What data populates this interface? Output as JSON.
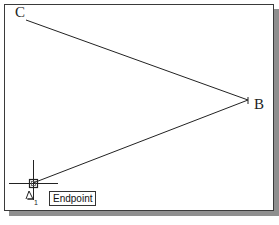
{
  "canvas": {
    "background": "#ffffff",
    "border_color": "#3a3a3a",
    "shadow_color": "#8f8f8f"
  },
  "points": [
    {
      "id": "C",
      "label": "C",
      "x": 26,
      "y": 20
    },
    {
      "id": "B",
      "label": "B",
      "x": 248,
      "y": 100
    },
    {
      "id": "A",
      "label": "A",
      "x": 33,
      "y": 183
    }
  ],
  "lines": [
    {
      "from": "C",
      "to": "B"
    },
    {
      "from": "B",
      "to": "A"
    }
  ],
  "cursor": {
    "x": 33,
    "y": 183,
    "ucs_label": "A",
    "ucs_subscript": "1"
  },
  "osnap_tooltip": {
    "label": "Endpoint"
  }
}
